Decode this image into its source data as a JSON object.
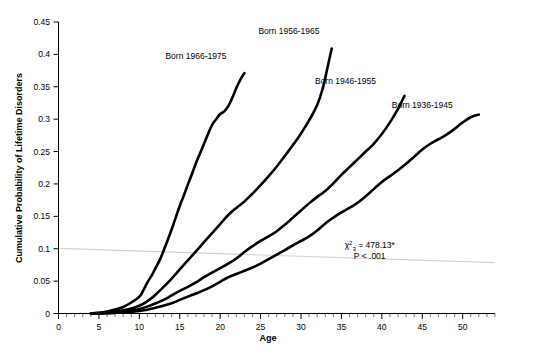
{
  "chart_data": {
    "type": "line",
    "title": "",
    "xlabel": "Age",
    "ylabel": "Cumulative Probability of Lifetime Disorders",
    "xlim": [
      0,
      54
    ],
    "ylim": [
      0,
      0.45
    ],
    "grid": false,
    "legend_position": "inline-labels",
    "x_ticks": [
      0,
      5,
      10,
      15,
      20,
      25,
      30,
      35,
      40,
      45,
      50
    ],
    "x_tick_labels": [
      "0",
      "5",
      "10",
      "15",
      "20",
      "25",
      "30",
      "35",
      "40",
      "45",
      "50"
    ],
    "x_minor_tick_step": 1,
    "y_ticks": [
      0,
      0.05,
      0.1,
      0.15,
      0.2,
      0.25,
      0.3,
      0.35,
      0.4,
      0.45
    ],
    "y_tick_labels": [
      "0",
      "0.05",
      "0.1",
      "0.15",
      "0.2",
      "0.25",
      "0.3",
      "0.35",
      "0.4",
      "0.45"
    ],
    "series": [
      {
        "name": "Born 1966-1975",
        "label": "Born 1966-1975",
        "label_x": 17.0,
        "label_y": 0.393,
        "color": "#000000",
        "points": [
          [
            4.0,
            0.0
          ],
          [
            5.0,
            0.001
          ],
          [
            6.0,
            0.003
          ],
          [
            7.0,
            0.006
          ],
          [
            8.0,
            0.01
          ],
          [
            9.0,
            0.017
          ],
          [
            10.0,
            0.026
          ],
          [
            10.5,
            0.036
          ],
          [
            11.0,
            0.048
          ],
          [
            11.5,
            0.058
          ],
          [
            12.0,
            0.07
          ],
          [
            12.5,
            0.082
          ],
          [
            13.0,
            0.097
          ],
          [
            13.5,
            0.113
          ],
          [
            14.0,
            0.13
          ],
          [
            14.5,
            0.148
          ],
          [
            15.0,
            0.166
          ],
          [
            15.5,
            0.182
          ],
          [
            16.0,
            0.199
          ],
          [
            16.5,
            0.215
          ],
          [
            17.0,
            0.232
          ],
          [
            17.5,
            0.247
          ],
          [
            18.0,
            0.262
          ],
          [
            18.5,
            0.277
          ],
          [
            19.0,
            0.291
          ],
          [
            19.5,
            0.3
          ],
          [
            20.0,
            0.308
          ],
          [
            20.5,
            0.312
          ],
          [
            21.0,
            0.32
          ],
          [
            21.5,
            0.333
          ],
          [
            22.0,
            0.348
          ],
          [
            22.5,
            0.361
          ],
          [
            23.0,
            0.371
          ]
        ]
      },
      {
        "name": "Born 1956-1965",
        "label": "Born 1956-1965",
        "label_x": 28.5,
        "label_y": 0.432,
        "color": "#000000",
        "points": [
          [
            4.0,
            0.0
          ],
          [
            5.5,
            0.001
          ],
          [
            7.0,
            0.003
          ],
          [
            8.5,
            0.006
          ],
          [
            10.0,
            0.012
          ],
          [
            11.0,
            0.019
          ],
          [
            12.0,
            0.029
          ],
          [
            13.0,
            0.041
          ],
          [
            14.0,
            0.054
          ],
          [
            15.0,
            0.068
          ],
          [
            16.0,
            0.082
          ],
          [
            17.0,
            0.096
          ],
          [
            18.0,
            0.11
          ],
          [
            19.0,
            0.124
          ],
          [
            20.0,
            0.138
          ],
          [
            21.0,
            0.152
          ],
          [
            22.0,
            0.163
          ],
          [
            23.0,
            0.173
          ],
          [
            24.0,
            0.185
          ],
          [
            25.0,
            0.198
          ],
          [
            26.0,
            0.212
          ],
          [
            27.0,
            0.227
          ],
          [
            28.0,
            0.243
          ],
          [
            29.0,
            0.26
          ],
          [
            30.0,
            0.278
          ],
          [
            31.0,
            0.298
          ],
          [
            32.0,
            0.322
          ],
          [
            32.7,
            0.348
          ],
          [
            33.3,
            0.381
          ],
          [
            33.8,
            0.409
          ]
        ]
      },
      {
        "name": "Born 1946-1955",
        "label": "Born 1946-1955",
        "label_x": 35.5,
        "label_y": 0.355,
        "color": "#000000",
        "points": [
          [
            4.0,
            0.0
          ],
          [
            6.0,
            0.001
          ],
          [
            8.0,
            0.003
          ],
          [
            10.0,
            0.007
          ],
          [
            11.5,
            0.013
          ],
          [
            13.0,
            0.021
          ],
          [
            14.0,
            0.028
          ],
          [
            15.0,
            0.035
          ],
          [
            16.0,
            0.041
          ],
          [
            17.0,
            0.048
          ],
          [
            18.0,
            0.056
          ],
          [
            19.0,
            0.063
          ],
          [
            20.0,
            0.07
          ],
          [
            21.0,
            0.077
          ],
          [
            22.0,
            0.085
          ],
          [
            23.0,
            0.095
          ],
          [
            24.0,
            0.104
          ],
          [
            25.0,
            0.112
          ],
          [
            26.0,
            0.119
          ],
          [
            27.0,
            0.127
          ],
          [
            28.0,
            0.137
          ],
          [
            29.0,
            0.148
          ],
          [
            30.0,
            0.159
          ],
          [
            31.0,
            0.17
          ],
          [
            32.0,
            0.18
          ],
          [
            33.0,
            0.189
          ],
          [
            34.0,
            0.201
          ],
          [
            35.0,
            0.214
          ],
          [
            36.0,
            0.226
          ],
          [
            37.0,
            0.238
          ],
          [
            38.0,
            0.25
          ],
          [
            39.0,
            0.262
          ],
          [
            40.0,
            0.277
          ],
          [
            41.0,
            0.295
          ],
          [
            42.0,
            0.316
          ],
          [
            42.8,
            0.336
          ]
        ]
      },
      {
        "name": "Born 1936-1945",
        "label": "Born 1936-1945",
        "label_x": 45.0,
        "label_y": 0.318,
        "color": "#000000",
        "points": [
          [
            4.0,
            0.0
          ],
          [
            7.0,
            0.001
          ],
          [
            10.0,
            0.004
          ],
          [
            12.0,
            0.009
          ],
          [
            14.0,
            0.016
          ],
          [
            15.0,
            0.021
          ],
          [
            16.0,
            0.026
          ],
          [
            17.0,
            0.031
          ],
          [
            18.0,
            0.036
          ],
          [
            19.0,
            0.042
          ],
          [
            20.0,
            0.049
          ],
          [
            21.0,
            0.056
          ],
          [
            22.0,
            0.061
          ],
          [
            23.0,
            0.066
          ],
          [
            24.0,
            0.071
          ],
          [
            25.0,
            0.077
          ],
          [
            26.0,
            0.084
          ],
          [
            27.0,
            0.091
          ],
          [
            28.0,
            0.098
          ],
          [
            29.0,
            0.105
          ],
          [
            30.0,
            0.112
          ],
          [
            31.0,
            0.119
          ],
          [
            32.0,
            0.128
          ],
          [
            33.0,
            0.139
          ],
          [
            34.0,
            0.148
          ],
          [
            35.0,
            0.156
          ],
          [
            36.0,
            0.163
          ],
          [
            37.0,
            0.171
          ],
          [
            38.0,
            0.181
          ],
          [
            39.0,
            0.192
          ],
          [
            40.0,
            0.203
          ],
          [
            41.0,
            0.212
          ],
          [
            42.0,
            0.221
          ],
          [
            43.0,
            0.231
          ],
          [
            44.0,
            0.242
          ],
          [
            45.0,
            0.253
          ],
          [
            46.0,
            0.262
          ],
          [
            47.0,
            0.269
          ],
          [
            48.0,
            0.276
          ],
          [
            49.0,
            0.285
          ],
          [
            50.0,
            0.295
          ],
          [
            51.0,
            0.303
          ],
          [
            52.0,
            0.307
          ]
        ]
      }
    ],
    "reference_line": {
      "name": "trend-reference-line",
      "color": "#d2d2d2",
      "points": [
        [
          0,
          0.1005
        ],
        [
          54,
          0.0785
        ]
      ]
    },
    "annotation": {
      "chi_symbol": "χ",
      "chi_superscript": "2",
      "chi_subscript": "3",
      "chi_value": "= 478.13*",
      "p_value": "P < .001",
      "x": 38.5,
      "y": 0.1015
    }
  }
}
